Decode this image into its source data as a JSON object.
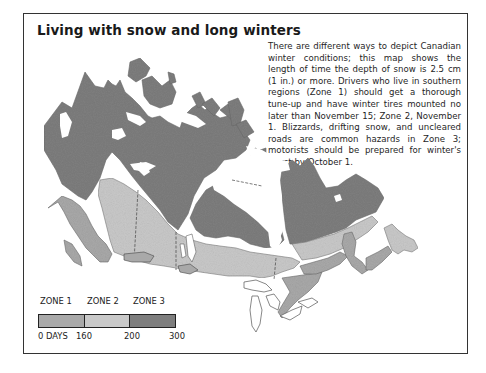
{
  "title": "Living with snow and long winters",
  "description": "There are different ways to depict Canadian winter conditions; this map shows the length of time the depth of snow is 2.5 cm (1 in.) or more. Drivers who live in southern regions (Zone 1) should get a thorough tune-up and have winter tires mounted no later than No­vember 15; Zone 2, November 1. Blizzards, drifting snow, and uncleared roads are com­mon hazards in Zone 3; motorists should be prepared for winter's worst by October 1.",
  "map": {
    "subject": "Canada",
    "zones": [
      {
        "name": "ZONE 1",
        "range_days": [
          0,
          160
        ],
        "color": "#a9a9a9",
        "winter_tires_by": "November 15"
      },
      {
        "name": "ZONE 2",
        "range_days": [
          160,
          200
        ],
        "color": "#c9c9c9",
        "winter_tires_by": "November 1"
      },
      {
        "name": "ZONE 3",
        "range_days": [
          200,
          300
        ],
        "color": "#7e7e7e",
        "winter_tires_by": "October 1"
      }
    ],
    "colors": {
      "zone1": "#a9a9a9",
      "zone2": "#c9c9c9",
      "zone3": "#7e7e7e",
      "water": "#ffffff",
      "outline": "#555555"
    }
  },
  "legend": {
    "labels": [
      "ZONE 1",
      "ZONE 2",
      "ZONE 3"
    ],
    "ticks": [
      "0 DAYS",
      "160",
      "200",
      "300"
    ]
  }
}
